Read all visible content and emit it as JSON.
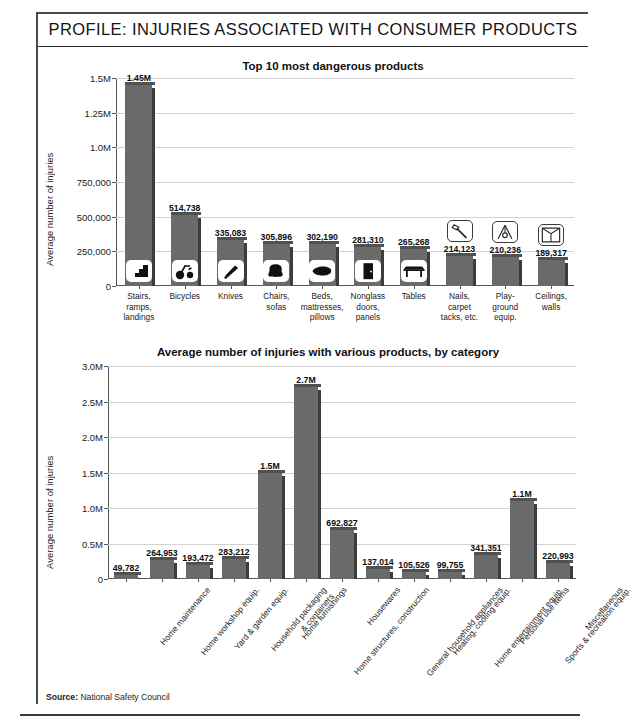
{
  "header": {
    "title": "PROFILE: INJURIES ASSOCIATED WITH CONSUMER PRODUCTS"
  },
  "footer": {
    "source_label": "Source:",
    "source_value": "National Safety Council"
  },
  "colors": {
    "bar_fill": "#6a6a6a",
    "bar_shade": "#3c3c3c",
    "grid": "#d2d2d2",
    "axis": "#555555",
    "text": "#1a1a1a",
    "frame": "#4a4a4a"
  },
  "chart_data": [
    {
      "id": "top-products",
      "type": "bar",
      "title": "Top 10 most dangerous products",
      "xlabel": "",
      "ylabel": "Average number of injuries",
      "ylim": [
        0,
        1500000
      ],
      "grid": true,
      "legend": "none",
      "ytick_labels": [
        "0",
        "250,000",
        "500,000",
        "750,000",
        "1.0M",
        "1.25M",
        "1.5M"
      ],
      "ytick_values": [
        0,
        250000,
        500000,
        750000,
        1000000,
        1250000,
        1500000
      ],
      "categories": [
        "Stairs,\nramps,\nlandings",
        "Bicycles",
        "Knives",
        "Chairs,\nsofas",
        "Beds,\nmattresses,\npillows",
        "Nonglass\ndoors,\npanels",
        "Tables",
        "Nails,\ncarpet\ntacks, etc.",
        "Play-\nground\nequip.",
        "Ceilings,\nwalls"
      ],
      "values": [
        1450000,
        514738,
        335083,
        305896,
        302190,
        281310,
        265268,
        214123,
        210236,
        189317
      ],
      "data_labels": [
        "1.45M",
        "514,738",
        "335,083",
        "305,896",
        "302,190",
        "281,310",
        "265,268",
        "214,123",
        "210,236",
        "189,317"
      ],
      "icons": [
        {
          "name": "stairs-icon",
          "style": "filled"
        },
        {
          "name": "tricycle-icon",
          "style": "filled"
        },
        {
          "name": "knife-icon",
          "style": "filled"
        },
        {
          "name": "chair-icon",
          "style": "filled"
        },
        {
          "name": "bed-pillow-icon",
          "style": "filled"
        },
        {
          "name": "door-icon",
          "style": "filled"
        },
        {
          "name": "table-icon",
          "style": "filled"
        },
        {
          "name": "hammer-nail-icon",
          "style": "outline"
        },
        {
          "name": "swing-set-icon",
          "style": "outline"
        },
        {
          "name": "ceiling-corner-icon",
          "style": "outline"
        }
      ]
    },
    {
      "id": "by-category",
      "type": "bar",
      "title": "Average number of injuries with various products, by category",
      "xlabel": "",
      "ylabel": "Average number of injuries",
      "ylim": [
        0,
        3000000
      ],
      "grid": true,
      "legend": "none",
      "ytick_labels": [
        "0",
        "0.5M",
        "1.0M",
        "1.5M",
        "2.0M",
        "2.5M",
        "3.0M"
      ],
      "ytick_values": [
        0,
        500000,
        1000000,
        1500000,
        2000000,
        2500000,
        3000000
      ],
      "categories": [
        "Home maintenance",
        "Home workshop equip.",
        "Yard & garden equip.",
        "Household packaging\n& containers",
        "Home furnishings",
        "Home structures, construction",
        "Housewares",
        "General household appliances",
        "Heating, cooling equip.",
        "Home entertainment equip.",
        "Personal use items",
        "Sports & recreation equip.",
        "Miscellaneous"
      ],
      "values": [
        49782,
        264953,
        193472,
        283212,
        1500000,
        2700000,
        692827,
        137014,
        105526,
        99755,
        341351,
        1100000,
        220993
      ],
      "data_labels": [
        "49,782",
        "264,953",
        "193,472",
        "283,212",
        "1.5M",
        "2.7M",
        "692,827",
        "137,014",
        "105,526",
        "99,755",
        "341,351",
        "1.1M",
        "220,993"
      ]
    }
  ]
}
